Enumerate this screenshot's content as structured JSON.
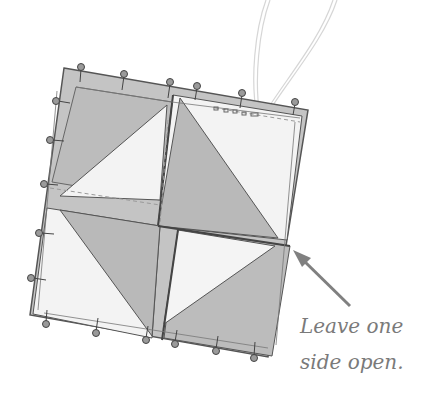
{
  "caption": {
    "line1": "Leave one",
    "line2": "side open."
  },
  "illustration": {
    "subject": "quilt-block-pinned-square",
    "blocks": [
      "top-left-half-square-triangle",
      "top-right-half-square-triangle",
      "bottom-left-half-square-triangle",
      "bottom-right-half-square-triangle"
    ],
    "annotation_arrow": "points-to-right-side-corner",
    "thread": "needle-thread-loop-top-right",
    "pins": 18
  },
  "colors": {
    "dark_fabric": "#b8b8b8",
    "light_fabric": "#f3f3f3",
    "outline": "#555555",
    "pin_head": "#9a9a9a",
    "arrow": "#808080",
    "caption_text": "#7a7a7a",
    "thread": "#d8d8d8"
  }
}
